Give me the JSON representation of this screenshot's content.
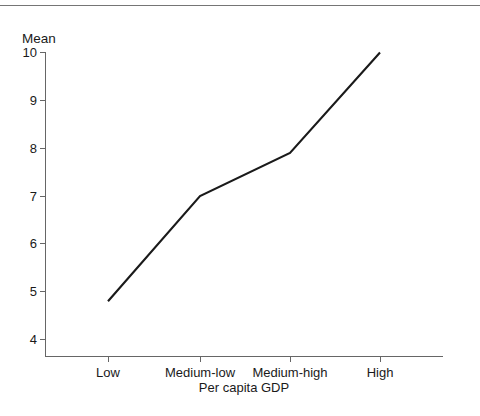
{
  "figure": {
    "background_color": "#ffffff",
    "rule_color": "#757575",
    "line_color": "#1a1a1a",
    "axis_color": "#666666",
    "top_rule_label": "top-divider"
  },
  "chart_data": {
    "type": "line",
    "title": "",
    "subtitle": "",
    "xlabel": "Per capita GDP",
    "ylabel": "Mean",
    "categories": [
      "Low",
      "Medium-low",
      "Medium-high",
      "High"
    ],
    "values": [
      4.8,
      7.0,
      7.9,
      10.0
    ],
    "series": [
      {
        "name": "Mean",
        "values": [
          4.8,
          7.0,
          7.9,
          10.0
        ]
      }
    ],
    "ylim": [
      3.72,
      10.0
    ],
    "yticks": [
      4,
      5,
      6,
      7,
      8,
      9,
      10
    ],
    "ytick_labels": [
      "4",
      "5",
      "6",
      "7",
      "8",
      "9",
      "10"
    ],
    "xtick_labels": [
      "Low",
      "Medium-low",
      "Medium-high",
      "High"
    ],
    "grid": false,
    "legend": false,
    "legend_position": "none",
    "annotations": []
  }
}
